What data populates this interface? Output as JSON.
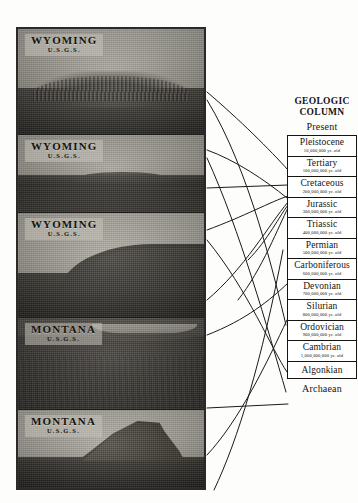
{
  "figure": {
    "photo_panels": [
      {
        "id": "panel-1",
        "place": "WYOMING",
        "agency": "U.S.G.S."
      },
      {
        "id": "panel-2",
        "place": "WYOMING",
        "agency": "U.S.G.S."
      },
      {
        "id": "panel-3",
        "place": "WYOMING",
        "agency": "U.S.G.S."
      },
      {
        "id": "panel-4",
        "place": "MONTANA",
        "agency": "U.S.G.S."
      },
      {
        "id": "panel-5",
        "place": "MONTANA",
        "agency": "U.S.G.S."
      }
    ],
    "column": {
      "title_line1": "GEOLOGIC",
      "title_line2": "COLUMN",
      "top_label": "Present",
      "bottom_label": "Archaean",
      "eras": [
        {
          "name": "Pleistocene",
          "age": "10,000,000 yr. old"
        },
        {
          "name": "Tertiary",
          "age": "100,000,000 yr. old"
        },
        {
          "name": "Cretaceous",
          "age": "200,000,000 yr. old"
        },
        {
          "name": "Jurassic",
          "age": "300,000,000 yr. old"
        },
        {
          "name": "Triassic",
          "age": "400,000,000 yr. old"
        },
        {
          "name": "Permian",
          "age": "500,000,000 yr. old"
        },
        {
          "name": "Carboniferous",
          "age": "600,000,000 yr. old"
        },
        {
          "name": "Devonian",
          "age": "700,000,000 yr. old"
        },
        {
          "name": "Silurian",
          "age": "800,000,000 yr. old"
        },
        {
          "name": "Ordovician",
          "age": "900,000,000 yr. old"
        },
        {
          "name": "Cambrian",
          "age": "1,000,000,000 yr. old"
        },
        {
          "name": "Algonkian",
          "age": ""
        }
      ]
    },
    "colors": {
      "ink": "#15140f",
      "paper": "#fdfdfc",
      "photo_border": "#2b2a28",
      "leader_line": "#1a1a18"
    }
  }
}
